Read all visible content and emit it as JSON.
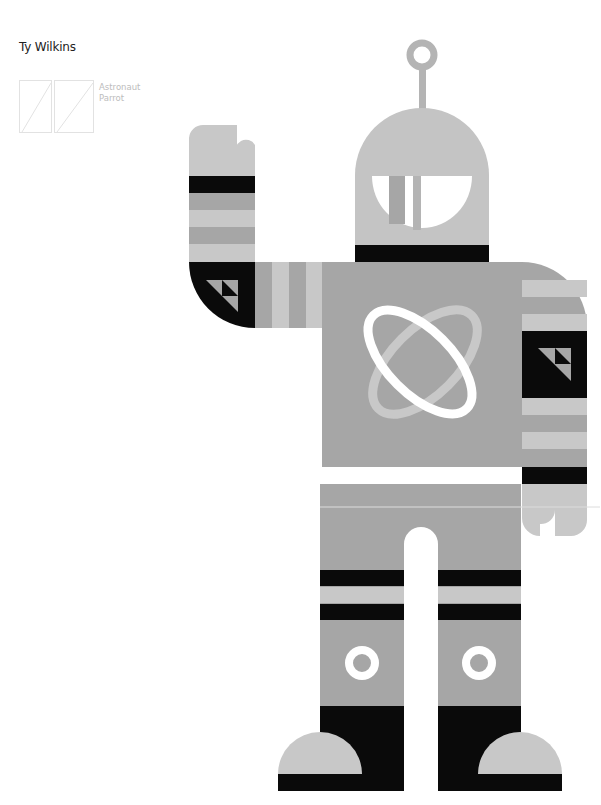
{
  "author": "Ty Wilkins",
  "captions": [
    "Astronaut",
    "Parrot"
  ],
  "thumbnails": [
    {
      "name": "astronaut-thumbnail",
      "label": "Astronaut"
    },
    {
      "name": "parrot-thumbnail",
      "label": "Parrot"
    }
  ],
  "artwork": {
    "subject": "astronaut-robot-illustration",
    "palette": {
      "background": "#ffffff",
      "black": "#0a0a0a",
      "mid_gray": "#a6a6a6",
      "light_gray": "#c8c8c8",
      "helmet_gray": "#c4c4c4",
      "white": "#ffffff"
    }
  }
}
